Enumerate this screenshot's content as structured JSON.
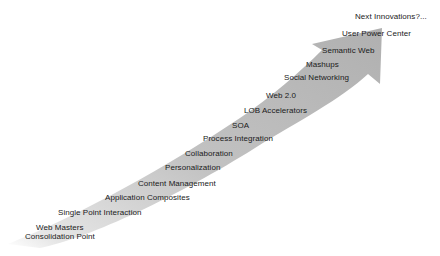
{
  "diagram": {
    "type": "evolution-arrow",
    "arrow_color": "#b8b8b8",
    "arrow_fade_color": "#ffffff",
    "text_color": "#1a1a1a",
    "milestones": [
      {
        "label": "Web Masters",
        "x": 36,
        "y": 223
      },
      {
        "label": "Consolidation Point",
        "x": 25,
        "y": 232
      },
      {
        "label": "Single Point Interaction",
        "x": 58,
        "y": 208
      },
      {
        "label": "Application Composites",
        "x": 105,
        "y": 193
      },
      {
        "label": "Content Management",
        "x": 138,
        "y": 179
      },
      {
        "label": "Personalization",
        "x": 165,
        "y": 163
      },
      {
        "label": "Collaboration",
        "x": 185,
        "y": 149
      },
      {
        "label": "Process Integration",
        "x": 203,
        "y": 134
      },
      {
        "label": "SOA",
        "x": 232,
        "y": 121
      },
      {
        "label": "LOB Accelerators",
        "x": 244,
        "y": 106
      },
      {
        "label": "Web 2.0",
        "x": 266,
        "y": 91
      },
      {
        "label": "Social Networking",
        "x": 284,
        "y": 73
      },
      {
        "label": "Mashups",
        "x": 306,
        "y": 60
      },
      {
        "label": "Semantic Web",
        "x": 322,
        "y": 46
      },
      {
        "label": "User Power Center",
        "x": 342,
        "y": 29
      },
      {
        "label": "Next Innovations?...",
        "x": 355,
        "y": 12
      }
    ]
  }
}
